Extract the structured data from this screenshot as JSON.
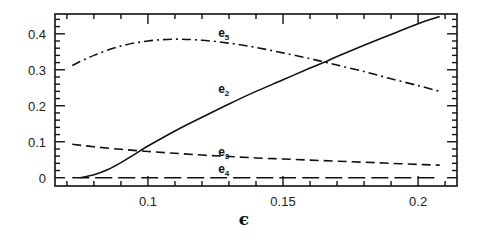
{
  "chart_data": {
    "type": "line",
    "title": "",
    "xlabel": "ϵ",
    "ylabel": "",
    "xlim": [
      0.0656,
      0.2144
    ],
    "ylim": [
      -0.023,
      0.455
    ],
    "grid": false,
    "legend": "inline labels",
    "x_ticks": [
      {
        "value": 0.1,
        "label": "0.1"
      },
      {
        "value": 0.15,
        "label": "0.15"
      },
      {
        "value": 0.2,
        "label": "0.2"
      }
    ],
    "y_ticks": [
      {
        "value": 0,
        "label": "0"
      },
      {
        "value": 0.1,
        "label": "0.1"
      },
      {
        "value": 0.2,
        "label": "0.2"
      },
      {
        "value": 0.3,
        "label": "0.3"
      },
      {
        "value": 0.4,
        "label": "0.4"
      }
    ],
    "series": [
      {
        "name": "e2",
        "label_base": "e",
        "label_sub": "2",
        "style": "solid",
        "label_at": [
          0.126,
          0.235
        ],
        "x": [
          0.075,
          0.08,
          0.085,
          0.09,
          0.095,
          0.1,
          0.11,
          0.12,
          0.13,
          0.14,
          0.15,
          0.16,
          0.165,
          0.17,
          0.18,
          0.19,
          0.2,
          0.208
        ],
        "y": [
          0.0,
          0.008,
          0.022,
          0.042,
          0.065,
          0.088,
          0.13,
          0.168,
          0.205,
          0.24,
          0.272,
          0.305,
          0.32,
          0.337,
          0.368,
          0.398,
          0.428,
          0.448
        ]
      },
      {
        "name": "e5",
        "label_base": "e",
        "label_sub": "5",
        "style": "dashdot",
        "label_at": [
          0.126,
          0.39
        ],
        "x": [
          0.072,
          0.08,
          0.09,
          0.1,
          0.11,
          0.12,
          0.13,
          0.14,
          0.15,
          0.16,
          0.165,
          0.17,
          0.18,
          0.19,
          0.2,
          0.208
        ],
        "y": [
          0.312,
          0.34,
          0.366,
          0.38,
          0.385,
          0.382,
          0.374,
          0.362,
          0.347,
          0.331,
          0.322,
          0.313,
          0.295,
          0.275,
          0.256,
          0.24
        ]
      },
      {
        "name": "e3",
        "label_base": "e",
        "label_sub": "3",
        "style": "dashed",
        "label_at": [
          0.126,
          0.06
        ],
        "x": [
          0.072,
          0.08,
          0.09,
          0.1,
          0.11,
          0.12,
          0.13,
          0.14,
          0.15,
          0.16,
          0.17,
          0.18,
          0.19,
          0.2,
          0.208
        ],
        "y": [
          0.093,
          0.086,
          0.079,
          0.073,
          0.068,
          0.063,
          0.059,
          0.055,
          0.052,
          0.049,
          0.046,
          0.043,
          0.04,
          0.037,
          0.035
        ]
      },
      {
        "name": "e4",
        "label_base": "e",
        "label_sub": "4",
        "style": "longdash",
        "label_at": [
          0.126,
          0.012
        ],
        "x": [
          0.072,
          0.1,
          0.15,
          0.208
        ],
        "y": [
          0.0,
          0.0,
          0.0,
          0.0
        ]
      }
    ]
  }
}
